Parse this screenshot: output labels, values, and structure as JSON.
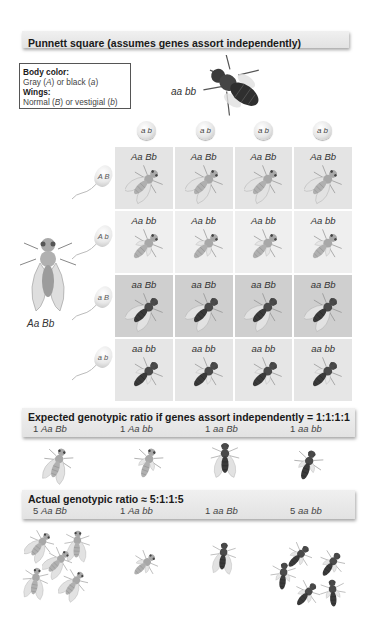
{
  "title": "Punnett square (assumes genes assort independently)",
  "legend": {
    "body_color_heading": "Body color:",
    "body_color_text_pre": "Gray (",
    "body_color_allele_dom": "A",
    "body_color_text_mid": ") or black (",
    "body_color_allele_rec": "a",
    "body_color_text_post": ")",
    "wings_heading": "Wings:",
    "wings_text_pre": "Normal (",
    "wings_allele_dom": "B",
    "wings_text_mid": ") or vestigial (",
    "wings_allele_rec": "b",
    "wings_text_post": ")"
  },
  "parents": {
    "top": {
      "genotype": "aa bb",
      "phenotype": "black-vestigial"
    },
    "left": {
      "genotype": "Aa Bb",
      "phenotype": "gray-normal"
    }
  },
  "egg_gametes": [
    "a b",
    "a b",
    "a b",
    "a b"
  ],
  "sperm_gametes": [
    "A B",
    "A b",
    "a B",
    "a b"
  ],
  "grid": {
    "rows": [
      {
        "genotype": "Aa Bb",
        "phenotype": "gray-normal",
        "bg": "#e4e4e4"
      },
      {
        "genotype": "Aa bb",
        "phenotype": "gray-vestigial",
        "bg": "#efefef"
      },
      {
        "genotype": "aa Bb",
        "phenotype": "black-normal",
        "bg": "#cfcfcf"
      },
      {
        "genotype": "aa bb",
        "phenotype": "black-vestigial",
        "bg": "#e6e6e6"
      }
    ],
    "cells": [
      [
        "Aa Bb",
        "Aa Bb",
        "Aa Bb",
        "Aa Bb"
      ],
      [
        "Aa bb",
        "Aa bb",
        "Aa bb",
        "Aa bb"
      ],
      [
        "aa Bb",
        "aa Bb",
        "aa Bb",
        "aa Bb"
      ],
      [
        "aa bb",
        "aa bb",
        "aa bb",
        "aa bb"
      ]
    ]
  },
  "expected": {
    "title": "Expected genotypic ratio if genes assort independently = 1:1:1:1",
    "items": [
      {
        "count": "1",
        "genotype": "Aa Bb",
        "flies": 1
      },
      {
        "count": "1",
        "genotype": "Aa bb",
        "flies": 1
      },
      {
        "count": "1",
        "genotype": "aa Bb",
        "flies": 1
      },
      {
        "count": "1",
        "genotype": "aa bb",
        "flies": 1
      }
    ]
  },
  "actual": {
    "title": "Actual genotypic ratio ≈ 5:1:1:5",
    "items": [
      {
        "count": "5",
        "genotype": "Aa Bb",
        "flies": 5
      },
      {
        "count": "1",
        "genotype": "Aa bb",
        "flies": 1
      },
      {
        "count": "1",
        "genotype": "aa Bb",
        "flies": 1
      },
      {
        "count": "5",
        "genotype": "aa bb",
        "flies": 5
      }
    ]
  },
  "colors": {
    "bar_bg": "#e6e6e6",
    "gray_body": "#b5b5b5",
    "black_body": "#3a3a3a",
    "wing": "#dcdcdc"
  }
}
